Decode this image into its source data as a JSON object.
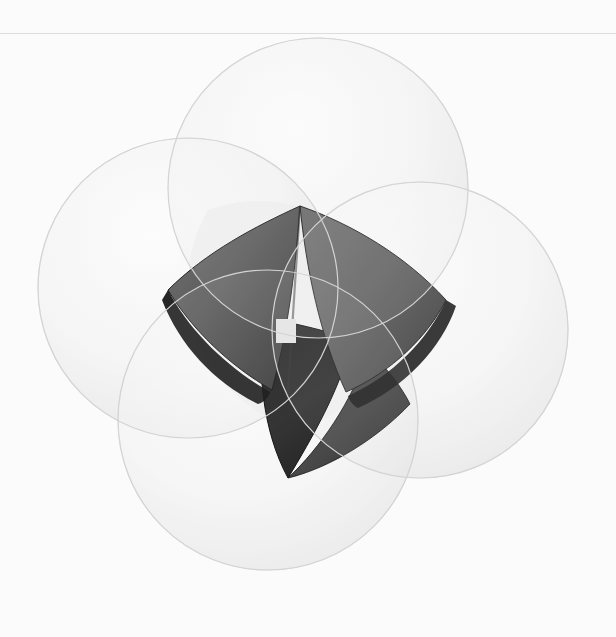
{
  "page": {
    "width": 616,
    "height": 637,
    "background_color": "#fbfbfb",
    "divider_color": "#dcdcdc",
    "divider_y": 33,
    "caption": "Geometric render: four translucent spheres in tetrahedral arrangement; their common intersection forms the dark Reuleaux tetrahedron at the center."
  },
  "palette": {
    "background": "#fbfbfb",
    "divider": "#dcdcdc",
    "sphere_fill_light": "#f2f2f2",
    "sphere_fill_mid": "#e8e8e8",
    "sphere_rim": "#cfcfcf",
    "sphere_shadow": "#d6d6d6",
    "core_face_light": "#6a6a6a",
    "core_face_mid": "#555555",
    "core_face_dark": "#3a3a3a",
    "core_face_darkest": "#111111",
    "core_edge": "#000000",
    "specular_highlight": "#e3e3e3"
  },
  "figure": {
    "type": "3d-geometry-render",
    "shading": "smooth-gradient",
    "spheres": [
      {
        "id": "sphere-top",
        "label": "Top sphere",
        "cx": 318,
        "cy": 188,
        "r": 150,
        "opacity": 0.2,
        "fill": "#d9d9d9"
      },
      {
        "id": "sphere-left",
        "label": "Upper-left sphere",
        "cx": 188,
        "cy": 288,
        "r": 150,
        "opacity": 0.2,
        "fill": "#d9d9d9"
      },
      {
        "id": "sphere-right",
        "label": "Right sphere",
        "cx": 420,
        "cy": 330,
        "r": 148,
        "opacity": 0.2,
        "fill": "#d9d9d9"
      },
      {
        "id": "sphere-bottom",
        "label": "Bottom-left sphere",
        "cx": 268,
        "cy": 420,
        "r": 150,
        "opacity": 0.2,
        "fill": "#d9d9d9"
      }
    ],
    "core": {
      "id": "reuleaux-tetrahedron",
      "label": "Reuleaux tetrahedron intersection solid",
      "center_x": 305,
      "center_y": 330,
      "highlight": {
        "id": "specular-patch",
        "x": 276,
        "y": 319,
        "width": 20,
        "height": 24,
        "color": "#e3e3e3"
      },
      "faces": [
        {
          "id": "face-upper-left",
          "tone": "#5c5c5c"
        },
        {
          "id": "face-upper-right",
          "tone": "#1a1a1a"
        },
        {
          "id": "face-center-right",
          "tone": "#5a5a5a"
        },
        {
          "id": "face-lower",
          "tone": "#2b2b2b"
        },
        {
          "id": "face-lower-right",
          "tone": "#3f3f3f"
        }
      ]
    }
  }
}
